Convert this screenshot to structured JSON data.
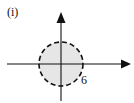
{
  "figure": {
    "label": "(i)",
    "colors": {
      "axis": "#111111",
      "circle_stroke": "#111111",
      "circle_fill": "#e6e6e6",
      "text": "#111111"
    }
  },
  "axes": {
    "x_axis": {
      "has_arrow": true,
      "direction": "right"
    },
    "y_axis": {
      "has_arrow": true,
      "direction": "up"
    }
  },
  "region": {
    "shape": "circle",
    "center": [
      0,
      0
    ],
    "radius": 6,
    "boundary": "dashed",
    "fill": "shaded",
    "radius_label": "6"
  }
}
